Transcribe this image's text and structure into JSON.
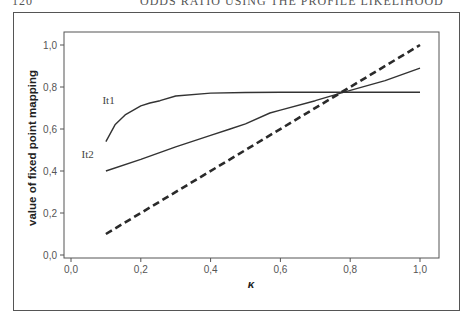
{
  "page": {
    "number": "120",
    "running_title": "ODDS RATIO USING THE PROFILE LIKELIHOOD"
  },
  "chart_data": {
    "type": "line",
    "title": "",
    "xlabel": "κ",
    "ylabel": "value of fixed point mapping",
    "xlim": [
      0.0,
      1.0
    ],
    "ylim": [
      0.0,
      1.0
    ],
    "x_ticks": [
      "0,0",
      "0,2",
      "0,4",
      "0,6",
      "0,8",
      "1,0"
    ],
    "y_ticks": [
      "0,0",
      "0,2",
      "0,4",
      "0,6",
      "0,8",
      "1,0"
    ],
    "grid": false,
    "legend": "inline labels",
    "series": [
      {
        "name": "It1",
        "style": "solid",
        "x": [
          0.1,
          0.126,
          0.155,
          0.2,
          0.226,
          0.255,
          0.3,
          0.4,
          0.5,
          0.6,
          0.7,
          0.78,
          0.9,
          1.0
        ],
        "y": [
          0.54,
          0.62,
          0.667,
          0.71,
          0.724,
          0.735,
          0.757,
          0.771,
          0.774,
          0.775,
          0.775,
          0.775,
          0.775,
          0.775
        ]
      },
      {
        "name": "It2",
        "style": "solid",
        "x": [
          0.1,
          0.2,
          0.3,
          0.4,
          0.456,
          0.5,
          0.57,
          0.6,
          0.7,
          0.78,
          0.9,
          1.0
        ],
        "y": [
          0.4,
          0.455,
          0.515,
          0.57,
          0.6,
          0.625,
          0.676,
          0.69,
          0.735,
          0.775,
          0.83,
          0.89
        ]
      },
      {
        "name": "identity",
        "style": "dashed",
        "x": [
          0.1,
          1.0
        ],
        "y": [
          0.1,
          1.0
        ]
      }
    ],
    "annotations": [
      {
        "text": "It1",
        "x": 0.09,
        "y": 0.72
      },
      {
        "text": "It2",
        "x": 0.03,
        "y": 0.46
      }
    ]
  }
}
